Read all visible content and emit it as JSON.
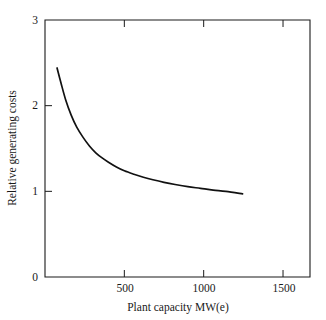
{
  "chart_data": {
    "type": "line",
    "title": "",
    "xlabel": "Plant capacity MW(e)",
    "ylabel": "Relative generating costs",
    "xlim": [
      0,
      1670
    ],
    "ylim": [
      0,
      3
    ],
    "xticks": [
      500,
      1000,
      1500
    ],
    "xtick_labels": [
      "500",
      "1000",
      "1500"
    ],
    "yticks": [
      0,
      1,
      2,
      3
    ],
    "ytick_labels": [
      "0",
      "1",
      "2",
      "3"
    ],
    "grid": false,
    "legend": null,
    "series": [
      {
        "name": "Relative generating costs",
        "color": "#111111",
        "x": [
          76,
          100,
          130,
          165,
          200,
          240,
          280,
          320,
          360,
          400,
          450,
          500,
          560,
          620,
          680,
          750,
          820,
          900,
          980,
          1060,
          1140,
          1245
        ],
        "y": [
          2.44,
          2.27,
          2.07,
          1.89,
          1.75,
          1.63,
          1.53,
          1.45,
          1.39,
          1.34,
          1.285,
          1.24,
          1.2,
          1.165,
          1.135,
          1.105,
          1.08,
          1.055,
          1.035,
          1.015,
          1.0,
          0.97
        ]
      }
    ]
  },
  "axes": {
    "x_tick_positions_px": [
      125,
      204,
      284
    ],
    "y_tick_positions_px": [
      277,
      191,
      105,
      20
    ],
    "plot_box_px": {
      "left": 45,
      "top": 20,
      "right": 310,
      "bottom": 277
    }
  }
}
